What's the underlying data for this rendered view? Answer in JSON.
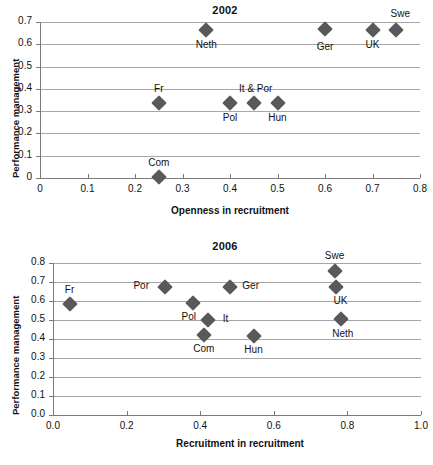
{
  "figure": {
    "marker_color": "#595959",
    "gridline_color": "#a6a6a6",
    "axis_color": "#7a7a7a",
    "background": "#ffffff"
  },
  "chart_data": [
    {
      "id": "2002",
      "type": "scatter",
      "title": "2002",
      "xlabel": "Openness in recruitment",
      "ylabel": "Performance management",
      "xlim": [
        0,
        0.8
      ],
      "ylim": [
        0,
        0.7
      ],
      "xticks": [
        "0",
        "0.1",
        "0.2",
        "0.3",
        "0.4",
        "0.5",
        "0.6",
        "0.7",
        "0.8"
      ],
      "xtick_values": [
        0,
        0.1,
        0.2,
        0.3,
        0.4,
        0.5,
        0.6,
        0.7,
        0.8
      ],
      "yticks": [
        "0",
        "0.1",
        "0.2",
        "0.3",
        "0.4",
        "0.5",
        "0.6",
        "0.7"
      ],
      "ytick_values": [
        0,
        0.1,
        0.2,
        0.3,
        0.4,
        0.5,
        0.6,
        0.7
      ],
      "grid": "horizontal",
      "legend": "none",
      "points": [
        {
          "label": "Com",
          "x": 0.25,
          "y": 0.005,
          "label_dx": 0,
          "label_dy": -20
        },
        {
          "label": "Fr",
          "x": 0.25,
          "y": 0.335,
          "label_dx": 0,
          "label_dy": -20
        },
        {
          "label": "Pol",
          "x": 0.4,
          "y": 0.335,
          "label_dx": 0,
          "label_dy": 9
        },
        {
          "label": "It  & Por",
          "x": 0.45,
          "y": 0.335,
          "label_dx": 2,
          "label_dy": -20
        },
        {
          "label": "Hun",
          "x": 0.5,
          "y": 0.335,
          "label_dx": 0,
          "label_dy": 9
        },
        {
          "label": "Neth",
          "x": 0.35,
          "y": 0.665,
          "label_dx": 0,
          "label_dy": 9
        },
        {
          "label": "Ger",
          "x": 0.6,
          "y": 0.667,
          "label_dx": 0,
          "label_dy": 12
        },
        {
          "label": "UK",
          "x": 0.7,
          "y": 0.665,
          "label_dx": 0,
          "label_dy": 9
        },
        {
          "label": "Swe",
          "x": 0.75,
          "y": 0.665,
          "label_dx": 4,
          "label_dy": -22
        }
      ]
    },
    {
      "id": "2006",
      "type": "scatter",
      "title": "2006",
      "xlabel": "Recruitment in recruitment",
      "ylabel": "Performance management",
      "xlim": [
        0,
        1.0
      ],
      "ylim": [
        0,
        0.8
      ],
      "xticks": [
        "0.0",
        "0.2",
        "0.4",
        "0.6",
        "0.8",
        "1.0"
      ],
      "xtick_values": [
        0,
        0.2,
        0.4,
        0.6,
        0.8,
        1.0
      ],
      "yticks": [
        "0.0",
        "0.1",
        "0.2",
        "0.3",
        "0.4",
        "0.5",
        "0.6",
        "0.7",
        "0.8"
      ],
      "ytick_values": [
        0,
        0.1,
        0.2,
        0.3,
        0.4,
        0.5,
        0.6,
        0.7,
        0.8
      ],
      "grid": "horizontal",
      "legend": "none",
      "points": [
        {
          "label": "Fr",
          "x": 0.045,
          "y": 0.585,
          "label_dx": 0,
          "label_dy": -20
        },
        {
          "label": "Por",
          "x": 0.305,
          "y": 0.672,
          "label_dx": -24,
          "label_dy": -7
        },
        {
          "label": "Pol",
          "x": 0.38,
          "y": 0.588,
          "label_dx": -4,
          "label_dy": 8
        },
        {
          "label": "It",
          "x": 0.42,
          "y": 0.502,
          "label_dx": 18,
          "label_dy": -7
        },
        {
          "label": "Com",
          "x": 0.41,
          "y": 0.422,
          "label_dx": 0,
          "label_dy": 8
        },
        {
          "label": "Hun",
          "x": 0.545,
          "y": 0.418,
          "label_dx": 0,
          "label_dy": 8
        },
        {
          "label": "Ger",
          "x": 0.48,
          "y": 0.673,
          "label_dx": 21,
          "label_dy": -7
        },
        {
          "label": "Swe",
          "x": 0.765,
          "y": 0.757,
          "label_dx": 0,
          "label_dy": -21
        },
        {
          "label": "UK",
          "x": 0.77,
          "y": 0.673,
          "label_dx": 4,
          "label_dy": 8
        },
        {
          "label": "Neth",
          "x": 0.782,
          "y": 0.507,
          "label_dx": 2,
          "label_dy": 9
        }
      ]
    }
  ]
}
